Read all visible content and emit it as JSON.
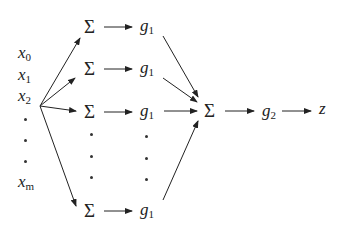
{
  "inputs": [
    {
      "base": "x",
      "sub": "0"
    },
    {
      "base": "x",
      "sub": "1"
    },
    {
      "base": "x",
      "sub": "2"
    },
    {
      "base": "x",
      "sub": "m"
    }
  ],
  "hidden_sum_symbol": "Σ",
  "hidden_activation": {
    "base": "g",
    "sub": "1"
  },
  "output_sum_symbol": "Σ",
  "output_activation": {
    "base": "g",
    "sub": "2"
  },
  "output": "z",
  "colors": {
    "ink": "#222222",
    "background": "#ffffff"
  }
}
